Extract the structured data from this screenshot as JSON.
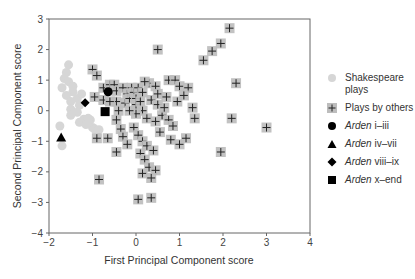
{
  "chart_data": {
    "type": "scatter",
    "title": "",
    "xlabel": "First Principal Component score",
    "ylabel": "Second Principal Component score",
    "xlim": [
      -2,
      4
    ],
    "ylim": [
      -4,
      3
    ],
    "xticks": [
      -2,
      -1,
      0,
      1,
      2,
      3,
      4
    ],
    "yticks": [
      3,
      2,
      1,
      0,
      -1,
      -2,
      -3,
      -4
    ],
    "grid": false,
    "legend_position": "right",
    "series": [
      {
        "name": "Shakespeare plays",
        "marker": "circle",
        "color": "#d6d6d6",
        "points": [
          [
            -1.55,
            1.5
          ],
          [
            -1.6,
            1.25
          ],
          [
            -1.65,
            1.05
          ],
          [
            -1.55,
            0.95
          ],
          [
            -1.7,
            0.75
          ],
          [
            -1.45,
            0.62
          ],
          [
            -1.6,
            0.5
          ],
          [
            -1.35,
            0.4
          ],
          [
            -1.5,
            0.3
          ],
          [
            -1.3,
            0.18
          ],
          [
            -1.5,
            0.05
          ],
          [
            -1.35,
            -0.05
          ],
          [
            -1.5,
            -0.15
          ],
          [
            -1.2,
            -0.28
          ],
          [
            -1.05,
            -0.3
          ],
          [
            -1.3,
            -0.38
          ],
          [
            -1.15,
            -0.45
          ],
          [
            -1.75,
            -0.5
          ],
          [
            -1.7,
            -1.15
          ],
          [
            -1.45,
            0.8
          ],
          [
            -1.0,
            -0.55
          ],
          [
            -0.95,
            -0.6
          ],
          [
            -0.85,
            -0.62
          ],
          [
            -1.1,
            -0.25
          ],
          [
            -1.25,
            0.55
          ]
        ]
      },
      {
        "name": "Plays by others",
        "marker": "square-plus",
        "color": "#bdbdbd",
        "points": [
          [
            -1.0,
            1.35
          ],
          [
            -0.9,
            1.15
          ],
          [
            -0.95,
            0.45
          ],
          [
            -0.75,
            0.75
          ],
          [
            -0.6,
            0.85
          ],
          [
            -0.5,
            0.85
          ],
          [
            -0.75,
            0.35
          ],
          [
            -0.45,
            0.65
          ],
          [
            -0.3,
            0.75
          ],
          [
            -0.45,
            0.3
          ],
          [
            -0.4,
            0.0
          ],
          [
            -0.45,
            -0.3
          ],
          [
            -0.35,
            -0.6
          ],
          [
            -0.2,
            0.55
          ],
          [
            -0.25,
            0.25
          ],
          [
            -0.15,
            0.4
          ],
          [
            -0.1,
            0.75
          ],
          [
            -0.05,
            0.6
          ],
          [
            0.0,
            0.4
          ],
          [
            0.0,
            0.2
          ],
          [
            0.05,
            0.75
          ],
          [
            0.15,
            0.6
          ],
          [
            0.1,
            0.3
          ],
          [
            0.15,
            0.0
          ],
          [
            0.0,
            -0.1
          ],
          [
            -0.3,
            -0.85
          ],
          [
            -0.2,
            -1.1
          ],
          [
            -0.45,
            -1.35
          ],
          [
            -0.65,
            -0.9
          ],
          [
            -0.9,
            -0.9
          ],
          [
            -0.85,
            -2.25
          ],
          [
            -0.05,
            -0.55
          ],
          [
            0.05,
            -0.8
          ],
          [
            0.15,
            -1.0
          ],
          [
            0.25,
            -1.15
          ],
          [
            0.1,
            -1.4
          ],
          [
            0.2,
            -1.6
          ],
          [
            0.3,
            -1.85
          ],
          [
            0.15,
            -2.05
          ],
          [
            0.45,
            -1.95
          ],
          [
            0.35,
            -2.2
          ],
          [
            0.05,
            -2.9
          ],
          [
            0.35,
            -2.85
          ],
          [
            0.3,
            0.9
          ],
          [
            0.45,
            0.8
          ],
          [
            0.5,
            0.55
          ],
          [
            0.7,
            0.45
          ],
          [
            0.35,
            0.35
          ],
          [
            0.5,
            0.2
          ],
          [
            0.25,
            -0.25
          ],
          [
            0.45,
            -0.35
          ],
          [
            0.6,
            -0.15
          ],
          [
            0.75,
            -0.3
          ],
          [
            0.55,
            -0.7
          ],
          [
            0.8,
            -0.95
          ],
          [
            0.75,
            1.0
          ],
          [
            0.9,
            1.0
          ],
          [
            1.0,
            0.8
          ],
          [
            1.2,
            0.75
          ],
          [
            1.1,
            0.5
          ],
          [
            0.95,
            0.3
          ],
          [
            1.3,
            0.1
          ],
          [
            1.35,
            -0.25
          ],
          [
            1.15,
            -0.9
          ],
          [
            1.0,
            -1.1
          ],
          [
            0.5,
            2.0
          ],
          [
            1.55,
            1.65
          ],
          [
            1.75,
            1.95
          ],
          [
            1.95,
            2.2
          ],
          [
            2.15,
            2.7
          ],
          [
            2.3,
            0.9
          ],
          [
            2.2,
            -0.25
          ],
          [
            1.95,
            -1.35
          ],
          [
            3.0,
            -0.55
          ],
          [
            0.2,
            0.95
          ],
          [
            -0.15,
            0.0
          ],
          [
            0.65,
            0.1
          ],
          [
            0.85,
            -0.5
          ],
          [
            0.4,
            -1.3
          ],
          [
            -0.6,
            0.3
          ]
        ]
      },
      {
        "name": "Arden i–iii",
        "marker": "circle",
        "color": "#000000",
        "points": [
          [
            -0.64,
            0.62
          ]
        ]
      },
      {
        "name": "Arden iv–vii",
        "marker": "triangle",
        "color": "#000000",
        "points": [
          [
            -1.72,
            -0.88
          ]
        ]
      },
      {
        "name": "Arden viii–ix",
        "marker": "diamond",
        "color": "#000000",
        "points": [
          [
            -1.17,
            0.26
          ]
        ]
      },
      {
        "name": "Arden x–end",
        "marker": "square",
        "color": "#000000",
        "points": [
          [
            -0.71,
            -0.03
          ]
        ]
      }
    ]
  },
  "legend": {
    "items": [
      {
        "title": "",
        "rest": "Shakespeare",
        "rest2": "plays"
      },
      {
        "title": "",
        "rest": "Plays by others"
      },
      {
        "title": "Arden",
        "rest": " i–iii"
      },
      {
        "title": "Arden",
        "rest": " iv–vii"
      },
      {
        "title": "Arden",
        "rest": " viii–ix"
      },
      {
        "title": "Arden",
        "rest": " x–end"
      }
    ]
  },
  "colors": {
    "shakespeare": "#d6d6d6",
    "others_fill": "#bdbdbd",
    "others_cross": "#222222",
    "arden": "#000000",
    "axis": "#666666"
  }
}
